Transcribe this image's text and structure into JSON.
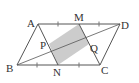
{
  "diagram": {
    "type": "geometry-figure",
    "shape": "parallelogram ABCD",
    "points": {
      "A": {
        "label": "A",
        "x": 38,
        "y": 24,
        "lx": 27,
        "ly": 27
      },
      "M": {
        "label": "M",
        "x": 79,
        "y": 24,
        "lx": 74,
        "ly": 21
      },
      "D": {
        "label": "D",
        "x": 120,
        "y": 24,
        "lx": 121,
        "ly": 29
      },
      "B": {
        "label": "B",
        "x": 17,
        "y": 65,
        "lx": 6,
        "ly": 72
      },
      "N": {
        "label": "N",
        "x": 58,
        "y": 65,
        "lx": 53,
        "ly": 76
      },
      "C": {
        "label": "C",
        "x": 100,
        "y": 65,
        "lx": 101,
        "ly": 74
      },
      "P": {
        "label": "P",
        "x": 49,
        "y": 44,
        "lx": 40,
        "ly": 49
      },
      "Q": {
        "label": "Q",
        "x": 89,
        "y": 44,
        "lx": 90,
        "ly": 52
      }
    },
    "shaded_region": "PMQN",
    "tick_marks": [
      "AM",
      "MD",
      "BN",
      "NC"
    ],
    "colors": {
      "line": "#555555",
      "shade": "#cccccc",
      "label": "#333333"
    }
  }
}
